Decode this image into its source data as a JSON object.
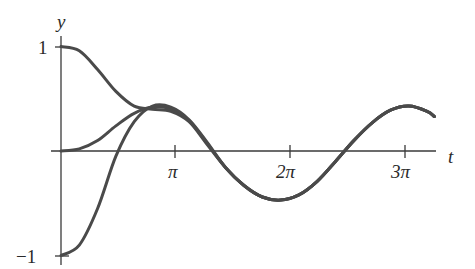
{
  "chart_data": {
    "type": "line",
    "title": "",
    "xlabel": "t",
    "ylabel": "y",
    "x_ticks": [
      {
        "value": 3.14159,
        "label": "π"
      },
      {
        "value": 6.28319,
        "label": "2π"
      },
      {
        "value": 9.42478,
        "label": "3π"
      }
    ],
    "y_ticks": [
      {
        "value": 1,
        "label": "1"
      },
      {
        "value": -1,
        "label": "−1"
      }
    ],
    "xlim": [
      0,
      10.2
    ],
    "ylim": [
      -1.05,
      1.05
    ],
    "grid": false,
    "legend": null,
    "line_color": "#4a4a4a",
    "series": [
      {
        "name": "y(0)=1",
        "x": [
          0,
          0.5,
          1,
          1.5,
          2,
          2.5,
          3,
          3.5,
          4,
          4.5,
          5,
          5.5,
          6,
          6.5,
          7,
          7.5,
          8,
          8.5,
          9,
          9.5,
          10,
          10.2
        ],
        "y": [
          1.0,
          0.96,
          0.78,
          0.57,
          0.43,
          0.4,
          0.38,
          0.28,
          0.06,
          -0.16,
          -0.33,
          -0.44,
          -0.47,
          -0.42,
          -0.29,
          -0.1,
          0.1,
          0.27,
          0.39,
          0.43,
          0.38,
          0.33
        ]
      },
      {
        "name": "y(0)=0",
        "x": [
          0,
          0.5,
          1,
          1.5,
          2,
          2.5,
          3,
          3.5,
          4,
          4.5,
          5,
          5.5,
          6,
          6.5,
          7,
          7.5,
          8,
          8.5,
          9,
          9.5,
          10,
          10.2
        ],
        "y": [
          0.0,
          0.02,
          0.1,
          0.24,
          0.36,
          0.42,
          0.4,
          0.29,
          0.07,
          -0.16,
          -0.33,
          -0.44,
          -0.47,
          -0.42,
          -0.29,
          -0.1,
          0.1,
          0.27,
          0.39,
          0.43,
          0.38,
          0.33
        ]
      },
      {
        "name": "y(0)=-1",
        "x": [
          0,
          0.5,
          1,
          1.5,
          2,
          2.5,
          3,
          3.5,
          4,
          4.5,
          5,
          5.5,
          6,
          6.5,
          7,
          7.5,
          8,
          8.5,
          9,
          9.5,
          10,
          10.2
        ],
        "y": [
          -1.0,
          -0.9,
          -0.55,
          -0.05,
          0.28,
          0.43,
          0.42,
          0.3,
          0.08,
          -0.16,
          -0.33,
          -0.44,
          -0.47,
          -0.42,
          -0.29,
          -0.1,
          0.1,
          0.27,
          0.39,
          0.43,
          0.38,
          0.33
        ]
      }
    ]
  },
  "labels": {
    "y_axis": "y",
    "x_axis": "t",
    "y_one": "1",
    "y_neg_one": "−1",
    "pi": "π",
    "two_pi": "2π",
    "three_pi": "3π"
  }
}
